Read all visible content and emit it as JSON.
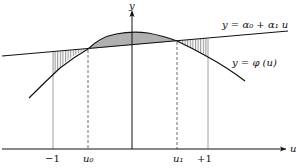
{
  "diagram": {
    "axes": {
      "x_label": "u",
      "y_label": "y"
    },
    "curves": {
      "line_label": "y = α₀ + α₁ u",
      "curve_label": "y = φ (u)"
    },
    "ticks": [
      {
        "label": "−1",
        "kind": "solid"
      },
      {
        "label": "u₀",
        "kind": "dashed"
      },
      {
        "label": "u₁",
        "kind": "dashed"
      },
      {
        "label": "+1",
        "kind": "solid"
      }
    ],
    "regions": [
      {
        "name": "hatched-region-left",
        "between": [
          "−1",
          "u₀"
        ],
        "fill": "vertical hatching"
      },
      {
        "name": "shaded-region-center",
        "between": [
          "u₀",
          "u₁"
        ],
        "fill": "#b0b0b0"
      },
      {
        "name": "hatched-region-right",
        "between": [
          "u₁",
          "+1"
        ],
        "fill": "vertical hatching"
      }
    ],
    "colors": {
      "stroke": "#111111",
      "shade": "#b0b0b0",
      "guide": "#888888"
    }
  }
}
